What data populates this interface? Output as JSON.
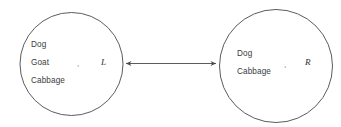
{
  "diagram": {
    "background_color": "#ffffff",
    "stroke_color": "#4a4a4a",
    "text_color": "#3b3b3b",
    "separator": ",",
    "nodes": [
      {
        "id": "left-bank",
        "set_label": "L",
        "items": [
          "Dog",
          "Goat",
          "Cabbage"
        ],
        "cx": 71.5,
        "cy": 64,
        "r": 51.5
      },
      {
        "id": "right-bank",
        "set_label": "R",
        "items": [
          "Dog",
          "Cabbage"
        ],
        "cx": 276,
        "cy": 66,
        "r": 56.5
      }
    ],
    "connector": {
      "id": "bidirectional-arrow",
      "style": "double-headed",
      "label": "",
      "x1": 124,
      "x2": 218,
      "y": 63.5
    }
  }
}
